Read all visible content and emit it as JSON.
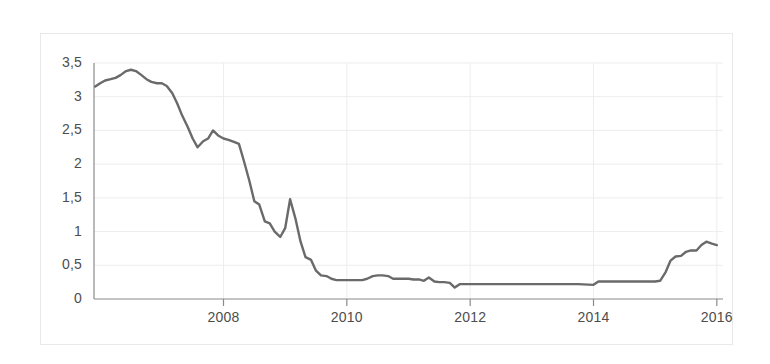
{
  "chart_data": {
    "type": "line",
    "title": "",
    "subtitle": "",
    "xlabel": "",
    "ylabel": "",
    "xlim": [
      2005.9,
      2016.1
    ],
    "ylim": [
      0,
      3.5
    ],
    "grid": true,
    "legend": null,
    "decimal_separator": ",",
    "y_ticks": [
      0,
      0.5,
      1,
      1.5,
      2,
      2.5,
      3,
      3.5
    ],
    "y_tick_labels": [
      "0",
      "0,5",
      "1",
      "1,5",
      "2",
      "2,5",
      "3",
      "3,5"
    ],
    "x_ticks": [
      2008,
      2010,
      2012,
      2014,
      2016
    ],
    "x_tick_labels": [
      "2008",
      "2010",
      "2012",
      "2014",
      "2016"
    ],
    "series": [
      {
        "name": "rate",
        "color": "#6a6a6a",
        "line_width": 2.4,
        "x": [
          2005.92,
          2006.0,
          2006.08,
          2006.17,
          2006.25,
          2006.33,
          2006.42,
          2006.5,
          2006.58,
          2006.67,
          2006.75,
          2006.83,
          2006.92,
          2007.0,
          2007.08,
          2007.17,
          2007.25,
          2007.33,
          2007.42,
          2007.5,
          2007.58,
          2007.67,
          2007.75,
          2007.83,
          2007.92,
          2008.0,
          2008.08,
          2008.17,
          2008.25,
          2008.33,
          2008.42,
          2008.5,
          2008.58,
          2008.67,
          2008.75,
          2008.83,
          2008.92,
          2009.0,
          2009.08,
          2009.17,
          2009.25,
          2009.33,
          2009.42,
          2009.5,
          2009.58,
          2009.67,
          2009.75,
          2009.83,
          2009.92,
          2010.0,
          2010.08,
          2010.17,
          2010.25,
          2010.33,
          2010.42,
          2010.5,
          2010.58,
          2010.67,
          2010.75,
          2010.83,
          2010.92,
          2011.0,
          2011.08,
          2011.17,
          2011.25,
          2011.33,
          2011.42,
          2011.5,
          2011.58,
          2011.67,
          2011.75,
          2011.83,
          2011.92,
          2012.0,
          2012.25,
          2012.5,
          2012.75,
          2013.0,
          2013.25,
          2013.5,
          2013.75,
          2014.0,
          2014.08,
          2014.25,
          2014.5,
          2014.75,
          2015.0,
          2015.08,
          2015.17,
          2015.25,
          2015.33,
          2015.42,
          2015.5,
          2015.58,
          2015.67,
          2015.75,
          2015.83,
          2015.92,
          2016.0
        ],
        "y": [
          3.15,
          3.2,
          3.24,
          3.26,
          3.28,
          3.32,
          3.38,
          3.4,
          3.38,
          3.32,
          3.26,
          3.22,
          3.2,
          3.2,
          3.16,
          3.05,
          2.9,
          2.72,
          2.55,
          2.38,
          2.25,
          2.34,
          2.38,
          2.5,
          2.42,
          2.38,
          2.36,
          2.33,
          2.3,
          2.05,
          1.75,
          1.45,
          1.4,
          1.15,
          1.12,
          1.0,
          0.92,
          1.05,
          1.48,
          1.18,
          0.85,
          0.62,
          0.58,
          0.42,
          0.35,
          0.34,
          0.3,
          0.28,
          0.28,
          0.28,
          0.28,
          0.28,
          0.28,
          0.3,
          0.34,
          0.35,
          0.35,
          0.34,
          0.3,
          0.3,
          0.3,
          0.3,
          0.29,
          0.29,
          0.27,
          0.32,
          0.26,
          0.25,
          0.25,
          0.24,
          0.17,
          0.22,
          0.22,
          0.22,
          0.22,
          0.22,
          0.22,
          0.22,
          0.22,
          0.22,
          0.22,
          0.21,
          0.26,
          0.26,
          0.26,
          0.26,
          0.26,
          0.27,
          0.4,
          0.57,
          0.63,
          0.64,
          0.7,
          0.72,
          0.72,
          0.8,
          0.85,
          0.82,
          0.8
        ]
      }
    ],
    "notes": {
      "peak_value": 3.4,
      "peak_year": 2006.5,
      "trough_value": 0.17,
      "trough_year": 2011.75,
      "final_value": 0.8
    }
  },
  "style": {
    "line_color": "#6a6a6a",
    "axis_color": "#8a8a8a",
    "grid_color": "#ededed",
    "frame_color": "#e9e9e9",
    "label_color": "#4d4d4d",
    "background": "#ffffff"
  }
}
